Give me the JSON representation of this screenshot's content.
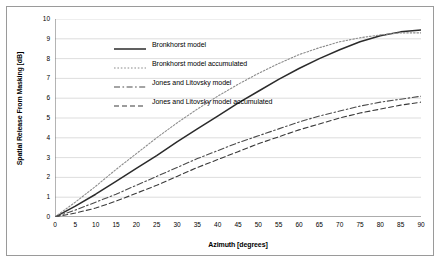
{
  "chart_data": {
    "type": "line",
    "title": "",
    "xlabel": "Azimuth [degrees]",
    "ylabel": "Spatial Release From Masking [dB]",
    "xlim": [
      0,
      90
    ],
    "ylim": [
      0,
      10
    ],
    "xticks": [
      "0",
      "5",
      "10",
      "15",
      "20",
      "25",
      "30",
      "35",
      "40",
      "45",
      "50",
      "55",
      "60",
      "65",
      "70",
      "75",
      "80",
      "85",
      "90"
    ],
    "yticks": [
      "0",
      "1",
      "2",
      "3",
      "4",
      "5",
      "6",
      "7",
      "8",
      "9",
      "10"
    ],
    "grid": "horizontal",
    "legend_position": "top-left",
    "x": [
      0,
      5,
      10,
      15,
      20,
      25,
      30,
      35,
      40,
      45,
      50,
      55,
      60,
      65,
      70,
      75,
      80,
      85,
      90
    ],
    "series": [
      {
        "name": "Bronkhorst model",
        "color": "#2b2b2b",
        "style": "solid",
        "values": [
          0,
          0.55,
          1.15,
          1.8,
          2.45,
          3.1,
          3.8,
          4.45,
          5.1,
          5.75,
          6.35,
          6.95,
          7.5,
          8.0,
          8.45,
          8.85,
          9.15,
          9.35,
          9.45
        ]
      },
      {
        "name": "Bronkhorst model accumulated",
        "color": "#8c8c8c",
        "style": "dotted",
        "values": [
          0,
          0.75,
          1.55,
          2.4,
          3.2,
          4.0,
          4.75,
          5.45,
          6.1,
          6.7,
          7.25,
          7.75,
          8.2,
          8.55,
          8.85,
          9.05,
          9.2,
          9.3,
          9.3
        ]
      },
      {
        "name": "Jones and Litovsky model",
        "color": "#4a4a4a",
        "style": "dash-dot",
        "values": [
          0,
          0.35,
          0.75,
          1.15,
          1.6,
          2.05,
          2.5,
          2.95,
          3.35,
          3.75,
          4.1,
          4.45,
          4.8,
          5.1,
          5.35,
          5.6,
          5.8,
          5.95,
          6.1
        ]
      },
      {
        "name": "Jones and Litovsky model accumulated",
        "color": "#3a3a3a",
        "style": "dashed",
        "values": [
          0,
          0.2,
          0.45,
          0.8,
          1.2,
          1.6,
          2.05,
          2.5,
          2.9,
          3.3,
          3.7,
          4.05,
          4.4,
          4.7,
          5.0,
          5.25,
          5.45,
          5.65,
          5.8
        ]
      }
    ]
  },
  "legend": {
    "items": [
      {
        "label": "Bronkhorst model"
      },
      {
        "label": "Bronkhorst model accumulated"
      },
      {
        "label": "Jones and Litovsky model"
      },
      {
        "label": "Jones and Litovsky model accumulated"
      }
    ]
  }
}
